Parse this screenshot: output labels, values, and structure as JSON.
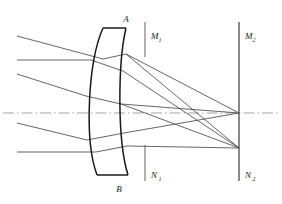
{
  "figure": {
    "type": "optical-ray-diagram",
    "width": 282,
    "height": 204,
    "background_color": "#ffffff",
    "line_color": "#3a3a3a",
    "lens_color": "#1a1a1a",
    "axis_color": "#8a8a8a"
  },
  "labels": {
    "lens_top": {
      "text": "A",
      "sub": "",
      "x": 126,
      "y": 22
    },
    "lens_bottom": {
      "text": "B",
      "sub": "",
      "x": 119,
      "y": 190
    },
    "stop_top": {
      "text": "M",
      "sub": "1",
      "x": 152,
      "y": 38
    },
    "stop_bottom": {
      "text": "N",
      "sub": "1",
      "x": 152,
      "y": 176
    },
    "plane_top": {
      "text": "M",
      "sub": "2",
      "x": 246,
      "y": 38
    },
    "plane_bottom": {
      "text": "N",
      "sub": "2",
      "x": 246,
      "y": 176
    }
  },
  "elements": {
    "optical_axis": {
      "name": "optical-axis",
      "y": 113,
      "x1": 3,
      "x2": 279,
      "style": "dash-dot"
    },
    "lens": {
      "name": "meniscus-lens",
      "front_surface": "M 103,28 C 88,62 84,140 97,175",
      "back_surface": "M 126,28 C 118,62 117,140 128,175",
      "top_edge": "M 103,28 L 126,28",
      "bottom_edge": "M 97,175 L 128,175"
    },
    "aperture_stop": {
      "name": "aperture-stop-M1N1",
      "x": 145,
      "top_segment": {
        "y1": 22,
        "y2": 57
      },
      "bottom_segment": {
        "y1": 145,
        "y2": 181
      }
    },
    "image_plane": {
      "name": "image-plane-M2N2",
      "x": 239,
      "y1": 22,
      "y2": 181
    },
    "focal_points": [
      {
        "name": "axial-focus",
        "x": 239,
        "y": 113
      },
      {
        "name": "off-axis-focus",
        "x": 239,
        "y": 148
      }
    ]
  },
  "rays": {
    "incoming": [
      {
        "name": "ray-upper-oblique",
        "x1": 17,
        "y1": 36,
        "x2": 103,
        "y2": 59
      },
      {
        "name": "ray-upper-horizontal",
        "x1": 17,
        "y1": 60,
        "x2": 91,
        "y2": 60
      },
      {
        "name": "ray-mid-oblique",
        "x1": 17,
        "y1": 74,
        "x2": 86,
        "y2": 96
      },
      {
        "name": "ray-lower-oblique",
        "x1": 17,
        "y1": 123,
        "x2": 87,
        "y2": 140
      },
      {
        "name": "ray-lower-horizontal",
        "x1": 17,
        "y1": 152,
        "x2": 96,
        "y2": 152
      }
    ],
    "internal": [
      {
        "name": "ray-internal-1",
        "x1": 103,
        "y1": 59,
        "x2": 126,
        "y2": 54
      },
      {
        "name": "ray-internal-2",
        "x1": 91,
        "y1": 60,
        "x2": 123,
        "y2": 71
      },
      {
        "name": "ray-internal-3",
        "x1": 86,
        "y1": 96,
        "x2": 121,
        "y2": 104
      },
      {
        "name": "ray-internal-4",
        "x1": 87,
        "y1": 140,
        "x2": 124,
        "y2": 133
      },
      {
        "name": "ray-internal-5",
        "x1": 96,
        "y1": 152,
        "x2": 127,
        "y2": 146
      }
    ],
    "outgoing": [
      {
        "name": "ray-out-1-to-lower-focus",
        "x1": 126,
        "y1": 54,
        "x2": 239,
        "y2": 148
      },
      {
        "name": "ray-out-2-to-lower-focus",
        "x1": 123,
        "y1": 71,
        "x2": 239,
        "y2": 148
      },
      {
        "name": "ray-out-3-to-axial-focus",
        "x1": 121,
        "y1": 104,
        "x2": 239,
        "y2": 113
      },
      {
        "name": "ray-out-4-to-axial-focus",
        "x1": 124,
        "y1": 133,
        "x2": 239,
        "y2": 113
      },
      {
        "name": "ray-out-5-to-lower-focus",
        "x1": 127,
        "y1": 146,
        "x2": 239,
        "y2": 148
      }
    ],
    "crossings": [
      {
        "name": "crossing-upper",
        "x": 150,
        "y": 76
      }
    ]
  }
}
